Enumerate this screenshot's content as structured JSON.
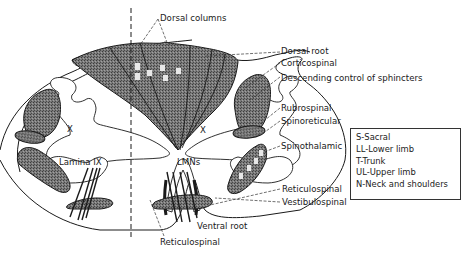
{
  "figure": {
    "labels": {
      "dorsal_columns": "Dorsal columns",
      "dorsal_root": "Dorsal root",
      "corticospinal": "Corticospinal",
      "descending_control": "Descending control of sphincters",
      "rubrospinal": "Rubrospinal",
      "spinoreticular": "Spinoreticular",
      "spinothalamic": "Spinothalamic",
      "reticulospinal_right": "Reticulospinal",
      "vestibulospinal": "Vestibulospinal",
      "ventral_root": "Ventral root",
      "reticulospinal_bottom": "Reticulospinal",
      "lamina_ix": "Lamina IX",
      "lmns": "LMNs",
      "lamina_x_left": "X",
      "lamina_x_right": "X"
    },
    "dorsal_column_letters": [
      "S",
      "L",
      "T",
      "U",
      "N"
    ],
    "spinothalamic_letters": [
      "S",
      "L",
      "T",
      "U"
    ]
  },
  "legend": {
    "items": [
      "S-Sacral",
      "LL-Lower limb",
      "T-Trunk",
      "UL-Upper limb",
      "N-Neck and shoulders"
    ]
  },
  "colors": {
    "stipple": "#6e6e6e",
    "ink": "#1a1a1a",
    "background": "#ffffff"
  }
}
